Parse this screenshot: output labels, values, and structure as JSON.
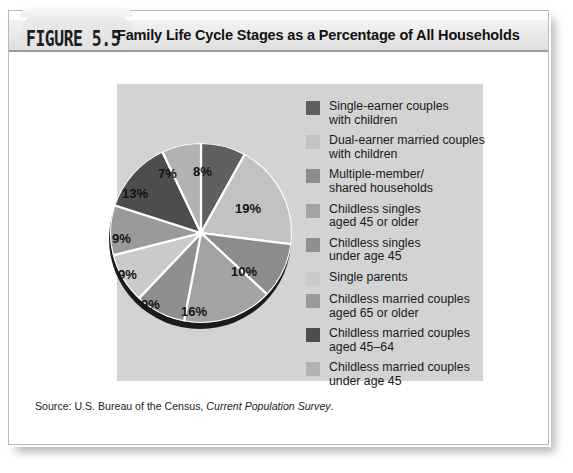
{
  "figure": {
    "label": "FIGURE 5.5",
    "title": "Family Life Cycle Stages as a Percentage of All Households",
    "source_prefix": "Source: U.S. Bureau of the Census, ",
    "source_italic": "Current Population Survey",
    "source_suffix": "."
  },
  "colors": {
    "panel_background": "#d3d3d3",
    "page_background": "#ffffff",
    "header_band": "#e7e7e7",
    "header_rule": "#9d9d9d",
    "pie_depth": "#1b1b1b",
    "slice_divider": "#ffffff",
    "text": "#1a1a1a"
  },
  "chart_data": {
    "type": "pie",
    "title": "Family Life Cycle Stages as a Percentage of All Households",
    "unit": "%",
    "legend_position": "right",
    "start_angle_deg": 0,
    "direction": "clockwise",
    "total": 100,
    "labels": [
      "Single-earner couples with children",
      "Dual-earner married couples with children",
      "Multiple-member/ shared households",
      "Childless singles aged 45 or older",
      "Childless singles under age 45",
      "Single parents",
      "Childless married couples aged 65 or older",
      "Childless married couples aged 45–64",
      "Childless married couples under age 45"
    ],
    "values": [
      8,
      19,
      10,
      16,
      9,
      9,
      9,
      13,
      7
    ],
    "value_labels": [
      "8%",
      "19%",
      "10%",
      "16%",
      "9%",
      "9%",
      "9%",
      "13%",
      "7%"
    ],
    "colors": [
      "#5f5f5f",
      "#c2c2c2",
      "#8c8c8c",
      "#a3a3a3",
      "#8f8f8f",
      "#cacaca",
      "#9a9a9a",
      "#4d4d4d",
      "#b2b2b2"
    ]
  },
  "legend": {
    "items": [
      {
        "label": "Single-earner couples\nwith children",
        "color": "#5f5f5f"
      },
      {
        "label": "Dual-earner married couples\nwith children",
        "color": "#c2c2c2"
      },
      {
        "label": "Multiple-member/\nshared households",
        "color": "#8c8c8c"
      },
      {
        "label": "Childless singles\naged 45 or older",
        "color": "#a3a3a3"
      },
      {
        "label": "Childless singles\nunder age 45",
        "color": "#8f8f8f"
      },
      {
        "label": "Single parents",
        "color": "#cacaca"
      },
      {
        "label": "Childless married couples\naged 65 or older",
        "color": "#9a9a9a"
      },
      {
        "label": "Childless married couples\naged 45–64",
        "color": "#4d4d4d"
      },
      {
        "label": "Childless married couples\nunder age 45",
        "color": "#b2b2b2"
      }
    ]
  },
  "slice_label_positions": [
    {
      "text": "8%",
      "left": 86,
      "top": 23
    },
    {
      "text": "19%",
      "left": 128,
      "top": 60
    },
    {
      "text": "10%",
      "left": 124,
      "top": 123
    },
    {
      "text": "16%",
      "left": 74,
      "top": 163
    },
    {
      "text": "9%",
      "left": 34,
      "top": 156
    },
    {
      "text": "9%",
      "left": 11,
      "top": 126
    },
    {
      "text": "9%",
      "left": 5,
      "top": 90
    },
    {
      "text": "13%",
      "left": 15,
      "top": 45
    },
    {
      "text": "7%",
      "left": 51,
      "top": 25
    }
  ]
}
